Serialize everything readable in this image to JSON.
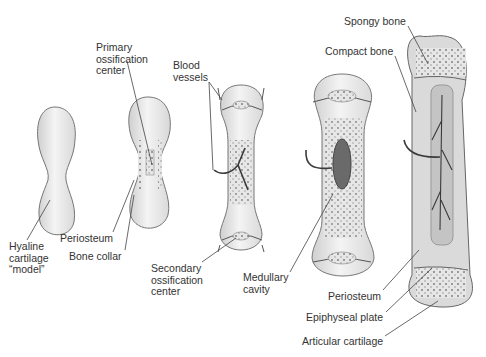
{
  "diagram": {
    "labels": {
      "hyaline": "Hyaline\ncartilage\n“model”",
      "primary": "Primary\nossification\ncenter",
      "blood": "Blood\nvessels",
      "periosteum_left": "Periosteum",
      "bone_collar": "Bone collar",
      "secondary": "Secondary\nossification\ncenter",
      "medullary": "Medullary\ncavity",
      "spongy": "Spongy bone",
      "compact": "Compact bone",
      "periosteum_right": "Periosteum",
      "epiphyseal": "Epiphyseal plate",
      "articular": "Articular cartilage"
    },
    "colors": {
      "outline": "#555555",
      "fill": "#e8e8e8",
      "cavity": "#6a6a6a",
      "vessel": "#3a3a3a",
      "label": "#333333"
    }
  }
}
